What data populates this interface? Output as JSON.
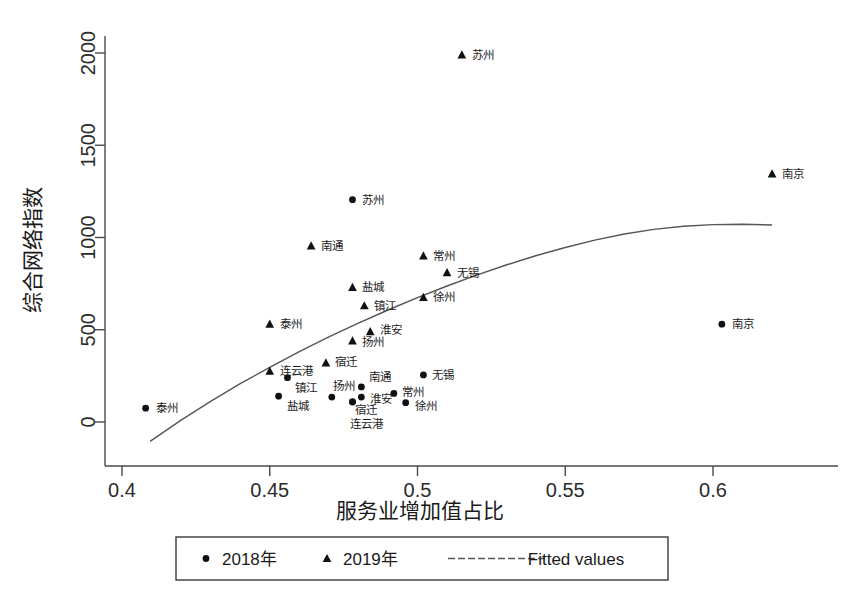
{
  "chart_data": {
    "type": "scatter",
    "title": "",
    "xlabel": "服务业增加值占比",
    "ylabel": "综合网络指数",
    "xlim": [
      0.395,
      0.632
    ],
    "ylim": [
      -120,
      2120
    ],
    "xticks": [
      "0.4",
      "0.45",
      "0.5",
      "0.55",
      "0.6"
    ],
    "xtick_values": [
      0.4,
      0.45,
      0.5,
      0.55,
      0.6
    ],
    "yticks": [
      "0",
      "500",
      "1000",
      "1500",
      "2000"
    ],
    "ytick_values": [
      0,
      500,
      1000,
      1500,
      2000
    ],
    "grid": false,
    "legend_position": "bottom-outside",
    "legend": [
      {
        "label": "2018年",
        "marker": "circle"
      },
      {
        "label": "2019年",
        "marker": "triangle"
      },
      {
        "label": "Fitted values",
        "marker": "line"
      }
    ],
    "series": [
      {
        "name": "2018年",
        "marker": "circle",
        "points": [
          {
            "label": "泰州",
            "x": 0.408,
            "y": 75,
            "lx": 10,
            "ly": 4
          },
          {
            "label": "苏州",
            "x": 0.478,
            "y": 1205,
            "lx": 10,
            "ly": 4
          },
          {
            "label": "南京",
            "x": 0.603,
            "y": 530,
            "lx": 10,
            "ly": 4
          },
          {
            "label": "镇江",
            "x": 0.456,
            "y": 240,
            "lx": 8,
            "ly": 14
          },
          {
            "label": "盐城",
            "x": 0.453,
            "y": 140,
            "lx": 8,
            "ly": 14
          },
          {
            "label": "扬州",
            "x": 0.471,
            "y": 135,
            "lx": 1,
            "ly": -7
          },
          {
            "label": "南通",
            "x": 0.481,
            "y": 190,
            "lx": 8,
            "ly": -6
          },
          {
            "label": "淮安",
            "x": 0.481,
            "y": 135,
            "lx": 9,
            "ly": 6
          },
          {
            "label": "常州",
            "x": 0.492,
            "y": 155,
            "lx": 8,
            "ly": 3
          },
          {
            "label": "徐州",
            "x": 0.496,
            "y": 105,
            "lx": 9,
            "ly": 7
          },
          {
            "label": "宿迁",
            "x": 0.478,
            "y": 110,
            "lx": 3,
            "ly": 12
          },
          {
            "label": "连云港",
            "x": 0.478,
            "y": 108,
            "lx": -2,
            "ly": 26
          },
          {
            "label": "无锡",
            "x": 0.502,
            "y": 255,
            "lx": 9,
            "ly": 4
          }
        ]
      },
      {
        "name": "2019年",
        "marker": "triangle",
        "points": [
          {
            "label": "苏州",
            "x": 0.515,
            "y": 1990,
            "lx": 10,
            "ly": 4
          },
          {
            "label": "南京",
            "x": 0.62,
            "y": 1345,
            "lx": 10,
            "ly": 4
          },
          {
            "label": "南通",
            "x": 0.464,
            "y": 955,
            "lx": 10,
            "ly": 4
          },
          {
            "label": "常州",
            "x": 0.502,
            "y": 900,
            "lx": 10,
            "ly": 4
          },
          {
            "label": "无锡",
            "x": 0.51,
            "y": 810,
            "lx": 10,
            "ly": 4
          },
          {
            "label": "盐城",
            "x": 0.478,
            "y": 730,
            "lx": 10,
            "ly": 4
          },
          {
            "label": "徐州",
            "x": 0.502,
            "y": 675,
            "lx": 10,
            "ly": 4
          },
          {
            "label": "镇江",
            "x": 0.482,
            "y": 630,
            "lx": 10,
            "ly": 4
          },
          {
            "label": "泰州",
            "x": 0.45,
            "y": 530,
            "lx": 10,
            "ly": 4
          },
          {
            "label": "淮安",
            "x": 0.484,
            "y": 490,
            "lx": 10,
            "ly": 2
          },
          {
            "label": "扬州",
            "x": 0.478,
            "y": 440,
            "lx": 10,
            "ly": 5
          },
          {
            "label": "宿迁",
            "x": 0.469,
            "y": 320,
            "lx": 9,
            "ly": 3
          },
          {
            "label": "连云港",
            "x": 0.45,
            "y": 275,
            "lx": 10,
            "ly": 4
          }
        ]
      }
    ],
    "fitted_curve": {
      "name": "Fitted values",
      "points": [
        {
          "x": 0.4095,
          "y": -105
        },
        {
          "x": 0.42,
          "y": 10
        },
        {
          "x": 0.43,
          "y": 112
        },
        {
          "x": 0.44,
          "y": 208
        },
        {
          "x": 0.45,
          "y": 296
        },
        {
          "x": 0.46,
          "y": 381
        },
        {
          "x": 0.47,
          "y": 461
        },
        {
          "x": 0.48,
          "y": 536
        },
        {
          "x": 0.49,
          "y": 607
        },
        {
          "x": 0.5,
          "y": 674
        },
        {
          "x": 0.51,
          "y": 737
        },
        {
          "x": 0.52,
          "y": 796
        },
        {
          "x": 0.53,
          "y": 851
        },
        {
          "x": 0.54,
          "y": 901
        },
        {
          "x": 0.55,
          "y": 946
        },
        {
          "x": 0.56,
          "y": 986
        },
        {
          "x": 0.57,
          "y": 1019
        },
        {
          "x": 0.58,
          "y": 1044
        },
        {
          "x": 0.59,
          "y": 1061
        },
        {
          "x": 0.6,
          "y": 1070
        },
        {
          "x": 0.61,
          "y": 1072
        },
        {
          "x": 0.62,
          "y": 1068
        }
      ]
    }
  }
}
